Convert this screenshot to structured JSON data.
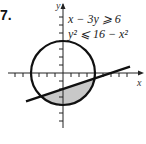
{
  "problem": {
    "number": "7.",
    "inequalities": [
      "x − 3y ⩾ 6",
      "y² ⩽ 16 − x²"
    ]
  },
  "figure": {
    "x_axis_label": "x",
    "y_axis_label": "y",
    "circle_radius": 4,
    "line": "x − 3y = 6",
    "shaded_region": "inside circle and below line",
    "colors": {
      "shade": "#c8c8c8",
      "stroke": "#111111"
    }
  }
}
